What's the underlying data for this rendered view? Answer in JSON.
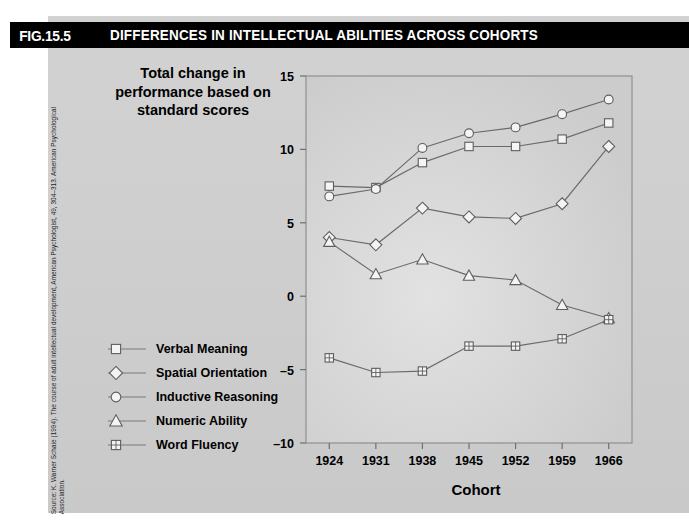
{
  "figure": {
    "number": "FIG.15.5",
    "title": "DIFFERENCES IN INTELLECTUAL ABILITIES ACROSS COHORTS",
    "source": "Source: K. Warner Schaie (1994). The course of adult intellectual development, American Psychologist, 49, 304–313. American Psychological Association.",
    "title_bar_color": "#000000",
    "title_text_color": "#ffffff",
    "panel_color": "#cfcfcf"
  },
  "chart_data": {
    "type": "line",
    "title": "Total change in performance based on standard scores",
    "xlabel": "Cohort",
    "ylabel": "Total change in performance based on standard scores",
    "categories": [
      "1924",
      "1931",
      "1938",
      "1945",
      "1952",
      "1959",
      "1966"
    ],
    "x": [
      1924,
      1931,
      1938,
      1945,
      1952,
      1959,
      1966
    ],
    "ylim": [
      -10,
      15
    ],
    "yticks": [
      -10,
      -5,
      0,
      5,
      10,
      15
    ],
    "yticklabels": [
      "–10",
      "–5",
      "0",
      "5",
      "10",
      "15"
    ],
    "grid": false,
    "legend_position": "left-outside",
    "series": [
      {
        "name": "Verbal Meaning",
        "marker": "square",
        "values": [
          7.5,
          7.4,
          9.1,
          10.2,
          10.2,
          10.7,
          11.8
        ]
      },
      {
        "name": "Spatial Orientation",
        "marker": "diamond",
        "values": [
          4.0,
          3.5,
          6.0,
          5.4,
          5.3,
          6.3,
          10.2
        ]
      },
      {
        "name": "Inductive Reasoning",
        "marker": "circle",
        "values": [
          6.8,
          7.3,
          10.1,
          11.1,
          11.5,
          12.4,
          13.4
        ]
      },
      {
        "name": "Numeric Ability",
        "marker": "triangle",
        "values": [
          3.7,
          1.5,
          2.5,
          1.4,
          1.1,
          -0.6,
          -1.5
        ]
      },
      {
        "name": "Word Fluency",
        "marker": "crossed-square",
        "values": [
          -4.2,
          -5.2,
          -5.1,
          -3.4,
          -3.4,
          -2.9,
          -1.6
        ]
      }
    ]
  }
}
